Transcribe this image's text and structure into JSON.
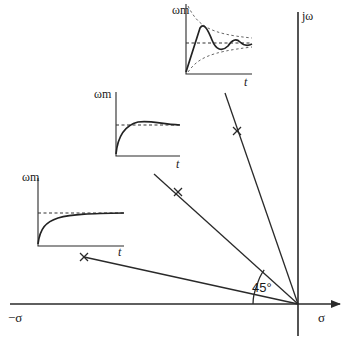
{
  "diagram": {
    "axes": {
      "real_positive_label": "σ",
      "real_negative_label": "−σ",
      "imag_label": "jω"
    },
    "angle_label": "45°",
    "rays": [
      {
        "id": "ray-low-damping",
        "pole_marker": "×"
      },
      {
        "id": "ray-45-deg",
        "pole_marker": "×"
      },
      {
        "id": "ray-high-damping",
        "pole_marker": "×"
      }
    ],
    "insets": [
      {
        "id": "inset-overdamped",
        "y_label": "ωm",
        "x_label": "t",
        "response": "no overshoot, monotonic rise to steady state"
      },
      {
        "id": "inset-45deg",
        "y_label": "ωm",
        "x_label": "t",
        "response": "slight overshoot then settles"
      },
      {
        "id": "inset-underdamped",
        "y_label": "ωm",
        "x_label": "t",
        "response": "oscillatory decaying within exponential envelope"
      }
    ]
  }
}
